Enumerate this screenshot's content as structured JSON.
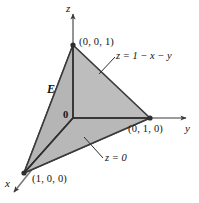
{
  "figure": {
    "fill_color": "#bdbdbd",
    "edge_color": "#3a3a3a",
    "axis_color": "#6e6e6e",
    "labels": {
      "z_axis": "z",
      "y_axis": "y",
      "x_axis": "x",
      "origin": "0",
      "region": "E",
      "vertex_z": "(0, 0, 1)",
      "vertex_y": "(0, 1, 0)",
      "vertex_x": "(1, 0, 0)",
      "top_surface": "z = 1 − x − y",
      "bottom_surface": "z = 0"
    },
    "caption": ""
  },
  "geometry": {
    "origin": [
      73,
      118
    ],
    "vertex_z": [
      73,
      45
    ],
    "vertex_y": [
      150,
      118
    ],
    "vertex_x": [
      24,
      173
    ],
    "z_axis_tip": [
      73,
      12
    ],
    "y_axis_tip": [
      190,
      118
    ],
    "x_axis_tip": [
      10,
      196
    ]
  }
}
